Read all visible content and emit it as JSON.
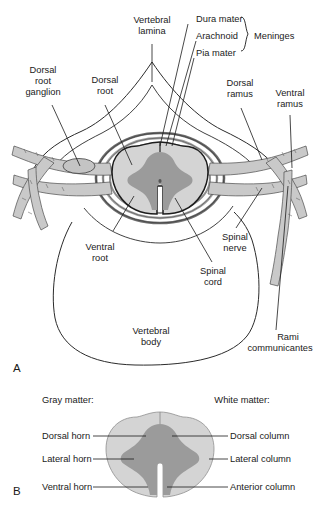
{
  "figure": {
    "type": "anatomical-diagram",
    "panels": [
      {
        "letter": "A",
        "name": "vertebra-with-spinal-cord"
      },
      {
        "letter": "B",
        "name": "spinal-cord-gray-white-matter"
      }
    ]
  },
  "colors": {
    "white_matter": "#d4d4d4",
    "gray_matter": "#9b9b9b",
    "nerve_fill": "#c9c9c9",
    "dura": "#808080",
    "arachnoid": "#a8a8a8",
    "pia": "#8a8a8a",
    "outline": "#2b2b2b",
    "text": "#1a1a1a"
  },
  "panel_a": {
    "letter": "A",
    "labels": {
      "vertebral_lamina": "Vertebral\nlamina",
      "vertebral_lamina_line1": "Vertebral",
      "vertebral_lamina_line2": "lamina",
      "dura_mater": "Dura mater",
      "arachnoid": "Arachnoid",
      "pia_mater": "Pia mater",
      "meninges": "Meninges",
      "dorsal_root_ganglion_line1": "Dorsal",
      "dorsal_root_ganglion_line2": "root",
      "dorsal_root_ganglion_line3": "ganglion",
      "dorsal_root_line1": "Dorsal",
      "dorsal_root_line2": "root",
      "dorsal_ramus_line1": "Dorsal",
      "dorsal_ramus_line2": "ramus",
      "ventral_ramus_line1": "Ventral",
      "ventral_ramus_line2": "ramus",
      "ventral_root_line1": "Ventral",
      "ventral_root_line2": "root",
      "spinal_nerve_line1": "Spinal",
      "spinal_nerve_line2": "nerve",
      "spinal_cord_line1": "Spinal",
      "spinal_cord_line2": "cord",
      "vertebral_body_line1": "Vertebral",
      "vertebral_body_line2": "body",
      "rami_communicantes_line1": "Rami",
      "rami_communicantes_line2": "communicantes"
    }
  },
  "panel_b": {
    "letter": "B",
    "headings": {
      "gray_matter": "Gray matter:",
      "white_matter": "White matter:"
    },
    "left_labels": [
      "Dorsal horn",
      "Lateral horn",
      "Ventral horn"
    ],
    "right_labels": [
      "Dorsal column",
      "Lateral column",
      "Anterior column"
    ]
  }
}
